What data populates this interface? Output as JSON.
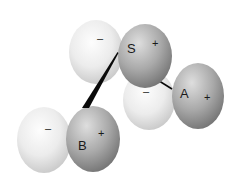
{
  "diagram": {
    "title": "",
    "colors": {
      "background": "#ffffff",
      "negative_lobe_light": "#fafafa",
      "negative_lobe_dark": "#c9c9c9",
      "positive_lobe_light": "#d8d8d8",
      "positive_lobe_dark": "#7c7c7c",
      "bond": "#0a0a0a",
      "text": "#1a1a1a"
    },
    "dipoles": [
      {
        "id": "S",
        "label": "S",
        "negative_sign": "–",
        "positive_sign": "+"
      },
      {
        "id": "A",
        "label": "A",
        "negative_sign": "–",
        "positive_sign": "+"
      },
      {
        "id": "B",
        "label": "B",
        "negative_sign": "–",
        "positive_sign": "+"
      }
    ],
    "connections": [
      {
        "from": "S",
        "to": "B",
        "style": "wedge"
      },
      {
        "from": "S",
        "to": "A",
        "style": "line"
      }
    ]
  }
}
